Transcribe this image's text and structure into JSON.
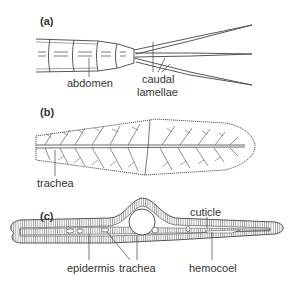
{
  "figure": {
    "panels": [
      {
        "id": "a",
        "label": "(a)",
        "annotations": [
          {
            "text": "abdomen"
          },
          {
            "text": "caudal"
          },
          {
            "text": "lamellae"
          }
        ]
      },
      {
        "id": "b",
        "label": "(b)",
        "annotations": [
          {
            "text": "trachea"
          }
        ]
      },
      {
        "id": "c",
        "label": "(c)",
        "annotations": [
          {
            "text": "cuticle"
          },
          {
            "text": "epidermis"
          },
          {
            "text": "trachea"
          },
          {
            "text": "hemocoel"
          }
        ]
      }
    ],
    "colors": {
      "line": "#444444",
      "text": "#333333",
      "background": "#ffffff"
    }
  }
}
